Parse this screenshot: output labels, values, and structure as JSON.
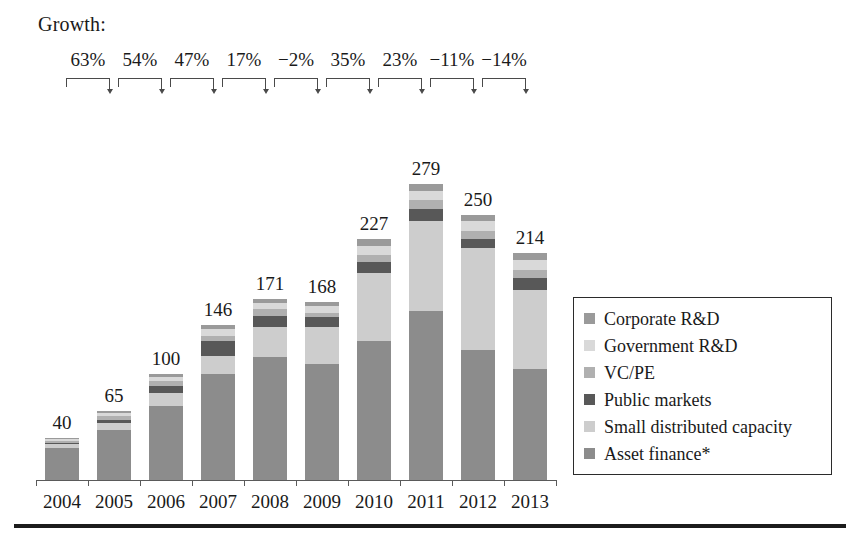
{
  "header": {
    "growth_label": "Growth:"
  },
  "chart_data": {
    "type": "bar",
    "stacked": true,
    "title": "",
    "subtitle": "",
    "xlabel": "",
    "ylabel": "",
    "grid": false,
    "legend_position": "right",
    "ylim": [
      0,
      300
    ],
    "categories": [
      "2004",
      "2005",
      "2006",
      "2007",
      "2008",
      "2009",
      "2010",
      "2011",
      "2012",
      "2013"
    ],
    "totals": [
      40,
      65,
      100,
      146,
      171,
      168,
      227,
      279,
      250,
      214
    ],
    "total_labels": [
      "40",
      "65",
      "100",
      "146",
      "171",
      "168",
      "227",
      "279",
      "250",
      "214"
    ],
    "growth_labels": [
      "63%",
      "54%",
      "47%",
      "17%",
      "−2%",
      "35%",
      "23%",
      "−11%",
      "−14%"
    ],
    "series": [
      {
        "name": "Asset finance*",
        "color": "#8c8c8c",
        "values": [
          30,
          47,
          70,
          100,
          116,
          109,
          131,
          159,
          123,
          105
        ]
      },
      {
        "name": "Small distributed capacity",
        "color": "#cdcdcd",
        "values": [
          4,
          7,
          12,
          17,
          28,
          35,
          64,
          85,
          96,
          74
        ]
      },
      {
        "name": "Public markets",
        "color": "#585858",
        "values": [
          1,
          3,
          7,
          14,
          11,
          10,
          11,
          12,
          8,
          12
        ]
      },
      {
        "name": "VC/PE",
        "color": "#b0b0b0",
        "values": [
          2,
          3,
          4,
          5,
          6,
          4,
          6,
          8,
          8,
          7
        ]
      },
      {
        "name": "Government R&D",
        "color": "#d9d9d9",
        "values": [
          2,
          3,
          4,
          6,
          6,
          6,
          9,
          9,
          9,
          10
        ]
      },
      {
        "name": "Corporate R&D",
        "color": "#9a9a9a",
        "values": [
          1,
          2,
          3,
          4,
          4,
          4,
          6,
          6,
          6,
          6
        ]
      }
    ]
  },
  "legend": {
    "items": [
      {
        "label": "Corporate R&D",
        "color": "#9a9a9a"
      },
      {
        "label": "Government R&D",
        "color": "#d9d9d9"
      },
      {
        "label": "VC/PE",
        "color": "#b0b0b0"
      },
      {
        "label": "Public markets",
        "color": "#585858"
      },
      {
        "label": "Small distributed capacity",
        "color": "#cdcdcd"
      },
      {
        "label": "Asset finance*",
        "color": "#8c8c8c"
      }
    ]
  },
  "colors": {
    "axis": "#5a5a5a",
    "text": "#1a1a1a",
    "bracket": "#4a4a4a",
    "legend_border": "#2b2b2b",
    "rule": "#1c1c1c",
    "background": "#ffffff"
  }
}
